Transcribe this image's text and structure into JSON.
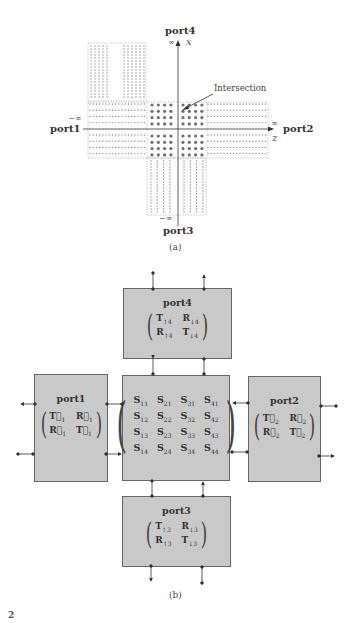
{
  "figure_a": {
    "caption": "(a)",
    "port_labels": {
      "top": "port4",
      "left": "port1",
      "right": "port2",
      "bottom": "port3"
    },
    "axis_labels": {
      "x": "x",
      "z": "z"
    },
    "infinity_labels": {
      "top": "∞",
      "left": "−∞",
      "right": "∞",
      "bottom": "−∞"
    },
    "annotation": "Intersection",
    "colors": {
      "dot_small": "#8a8a8a",
      "dot_large": "#6f6f6f",
      "axis": "#333333",
      "dash_border": "#999999"
    }
  },
  "figure_b": {
    "caption": "(b)",
    "boxes": {
      "port4": {
        "title": "port4",
        "matrix": [
          [
            "T",
            "↑4",
            "R",
            "↓4"
          ],
          [
            "R",
            "↑4",
            "T",
            "↓4"
          ]
        ]
      },
      "port1": {
        "title": "port1",
        "matrix": [
          [
            "T⃗",
            "1",
            "R⃗",
            "1"
          ],
          [
            "R⃖",
            "1",
            "T⃖",
            "1"
          ]
        ]
      },
      "port2": {
        "title": "port2",
        "matrix": [
          [
            "T⃗",
            "2",
            "R⃗",
            "2"
          ],
          [
            "R⃖",
            "2",
            "T⃖",
            "2"
          ]
        ]
      },
      "port3": {
        "title": "port3",
        "matrix": [
          [
            "T",
            "↑3",
            "R",
            "↓3"
          ],
          [
            "R",
            "↑3",
            "T",
            "↓3"
          ]
        ]
      },
      "center": {
        "matrix": [
          [
            [
              "S",
              "11"
            ],
            [
              "S",
              "21"
            ],
            [
              "S",
              "31"
            ],
            [
              "S",
              "41"
            ]
          ],
          [
            [
              "S",
              "12"
            ],
            [
              "S",
              "22"
            ],
            [
              "S",
              "32"
            ],
            [
              "S",
              "42"
            ]
          ],
          [
            [
              "S",
              "13"
            ],
            [
              "S",
              "23"
            ],
            [
              "S",
              "33"
            ],
            [
              "S",
              "43"
            ]
          ],
          [
            [
              "S",
              "14"
            ],
            [
              "S",
              "24"
            ],
            [
              "S",
              "34"
            ],
            [
              "S",
              "44"
            ]
          ]
        ]
      }
    },
    "colors": {
      "box_fill": "#c9c9c9",
      "box_border": "#666666",
      "arrow": "#333333"
    }
  },
  "footer": {
    "text": "2"
  }
}
